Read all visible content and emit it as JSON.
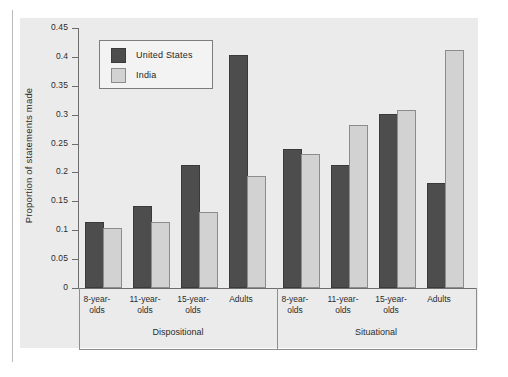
{
  "chart_data": {
    "type": "bar",
    "title": "",
    "xlabel": "",
    "ylabel": "Proportion of statements made",
    "ylim": [
      0,
      0.45
    ],
    "yticks": [
      "0",
      "0.05",
      "0.1",
      "0.15",
      "0.2",
      "0.25",
      "0.3",
      "0.35",
      "0.4",
      "0.45"
    ],
    "ytick_values": [
      0,
      0.05,
      0.1,
      0.15,
      0.2,
      0.25,
      0.3,
      0.35,
      0.4,
      0.45
    ],
    "grid": false,
    "legend_position": "upper-left-inside",
    "panels": [
      "Dispositional",
      "Situational"
    ],
    "categories": [
      "8-year-olds",
      "11-year-olds",
      "15-year-olds",
      "Adults"
    ],
    "category_lines": [
      [
        "8-year-",
        "olds"
      ],
      [
        "11-year-",
        "olds"
      ],
      [
        "15-year-",
        "olds"
      ],
      [
        "Adults",
        ""
      ]
    ],
    "series": [
      {
        "name": "United States",
        "color": "#4d4d4d",
        "values": {
          "Dispositional": [
            0.11,
            0.138,
            0.21,
            0.4
          ],
          "Situational": [
            0.238,
            0.21,
            0.297,
            0.178
          ]
        }
      },
      {
        "name": "India",
        "color": "#d2d2d2",
        "values": {
          "Dispositional": [
            0.1,
            0.11,
            0.128,
            0.19
          ],
          "Situational": [
            0.228,
            0.278,
            0.305,
            0.408
          ]
        }
      }
    ]
  },
  "legend": {
    "entries": [
      {
        "label": "United States",
        "swatch": "us"
      },
      {
        "label": "India",
        "swatch": "india"
      }
    ]
  },
  "axis": {
    "y_title": "Proportion of statements made"
  }
}
